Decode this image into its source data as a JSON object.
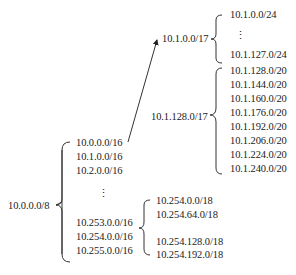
{
  "root": {
    "label": "10.0.0.0/8"
  },
  "level1": {
    "items": [
      "10.0.0.0/16",
      "10.1.0.0/16",
      "10.2.0.0/16",
      "⋮",
      "10.253.0.0/16",
      "10.254.0.0/16",
      "10.255.0.0/16"
    ]
  },
  "subnet_10_1": {
    "upper": {
      "label": "10.1.0.0/17",
      "items": [
        "10.1.0.0/24",
        "⋮",
        "10.1.127.0/24"
      ]
    },
    "lower": {
      "label": "10.1.128.0/17",
      "items": [
        "10.1.128.0/20",
        "10.1.144.0/20",
        "10.1.160.0/20",
        "10.1.176.0/20",
        "10.1.192.0/20",
        "10.1.206.0/20",
        "10.1.224.0/20",
        "10.1.240.0/20"
      ]
    }
  },
  "subnet_10_254": {
    "items": [
      "10.254.0.0/18",
      "10.254.64.0/18",
      "10.254.128.0/18",
      "10.254.192.0/18"
    ]
  }
}
